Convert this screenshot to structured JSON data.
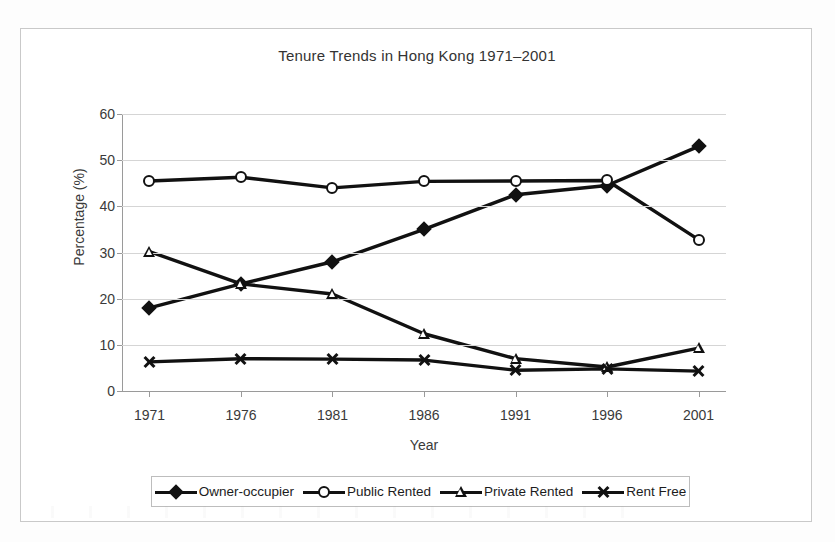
{
  "chart_data": {
    "type": "line",
    "title": "Tenure Trends in Hong Kong 1971–2001",
    "xlabel": "Year",
    "ylabel": "Percentage (%)",
    "categories": [
      "1971",
      "1976",
      "1981",
      "1986",
      "1991",
      "1996",
      "2001"
    ],
    "ylim": [
      0,
      60
    ],
    "yticks": [
      "0",
      "10",
      "20",
      "30",
      "40",
      "50",
      "60"
    ],
    "grid": true,
    "legend_position": "bottom",
    "series": [
      {
        "name": "Owner-occupier",
        "marker": "filled-diamond",
        "values": [
          18.0,
          23.2,
          28.0,
          35.0,
          42.5,
          44.5,
          53.0
        ]
      },
      {
        "name": "Public Rented",
        "marker": "open-circle",
        "values": [
          45.5,
          46.3,
          44.0,
          45.4,
          45.5,
          45.6,
          32.8
        ]
      },
      {
        "name": "Private Rented",
        "marker": "open-triangle",
        "values": [
          30.2,
          23.2,
          21.0,
          12.4,
          7.0,
          5.2,
          9.3
        ]
      },
      {
        "name": "Rent Free",
        "marker": "x-cross",
        "values": [
          6.3,
          7.0,
          6.9,
          6.7,
          4.5,
          4.8,
          4.3
        ]
      }
    ]
  },
  "colors": {
    "series_stroke": "#111111",
    "gridline": "#d5d5d5",
    "axis": "#9a9a9a",
    "frame_border": "#c9c9c9",
    "text": "#2b2b2b",
    "background": "#ffffff"
  }
}
